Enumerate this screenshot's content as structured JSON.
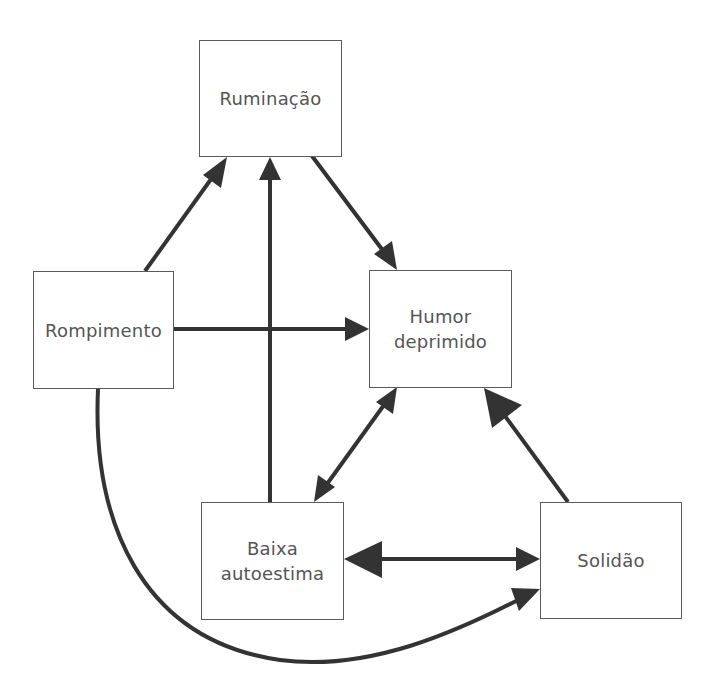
{
  "diagram": {
    "colors": {
      "arrow": "#333333",
      "box_border": "#5a5a5a",
      "text": "#555555",
      "background": "#ffffff"
    },
    "nodes": [
      {
        "id": "ruminacao",
        "label": "Ruminação",
        "x": 199,
        "y": 40,
        "w": 143,
        "h": 117
      },
      {
        "id": "rompimento",
        "label": "Rompimento",
        "x": 33,
        "y": 271,
        "w": 141,
        "h": 118
      },
      {
        "id": "humor",
        "label": "Humor\ndeprimido",
        "x": 369,
        "y": 270,
        "w": 143,
        "h": 118
      },
      {
        "id": "baixa",
        "label": "Baixa\nautoestima",
        "x": 201,
        "y": 502,
        "w": 143,
        "h": 118
      },
      {
        "id": "solidao",
        "label": "Solidão",
        "x": 540,
        "y": 502,
        "w": 142,
        "h": 117
      }
    ],
    "edges": [
      {
        "from": "rompimento",
        "to": "ruminacao",
        "type": "directed"
      },
      {
        "from": "baixa",
        "to": "ruminacao",
        "type": "directed"
      },
      {
        "from": "ruminacao",
        "to": "humor",
        "type": "directed"
      },
      {
        "from": "rompimento",
        "to": "humor",
        "type": "directed"
      },
      {
        "from": "humor",
        "to": "baixa",
        "type": "bidirectional"
      },
      {
        "from": "solidao",
        "to": "humor",
        "type": "directed"
      },
      {
        "from": "baixa",
        "to": "solidao",
        "type": "bidirectional"
      },
      {
        "from": "rompimento",
        "to": "solidao",
        "type": "directed-curved"
      }
    ]
  }
}
